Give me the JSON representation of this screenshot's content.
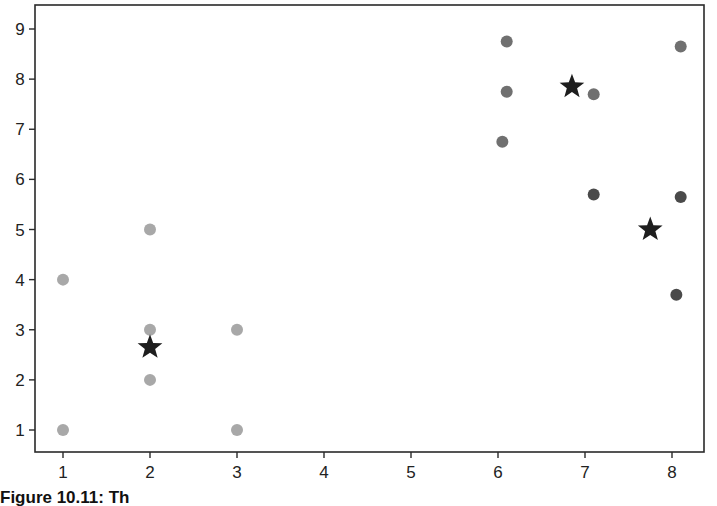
{
  "caption": "Figure 10.11: Th",
  "chart_data": {
    "type": "scatter",
    "title": "",
    "xlabel": "",
    "ylabel": "",
    "xlim": [
      0.7,
      8.3
    ],
    "ylim": [
      0.5,
      9.5
    ],
    "xticks": [
      1,
      2,
      3,
      4,
      5,
      6,
      7,
      8
    ],
    "yticks": [
      1,
      2,
      3,
      4,
      5,
      6,
      7,
      8,
      9
    ],
    "grid": false,
    "legend": null,
    "series": [
      {
        "name": "cluster-1",
        "marker": "circle",
        "color": "#a8a8a8",
        "points": [
          [
            1,
            4
          ],
          [
            2,
            5
          ],
          [
            2,
            3
          ],
          [
            2,
            2
          ],
          [
            1,
            1
          ],
          [
            3,
            3
          ],
          [
            3,
            1
          ]
        ]
      },
      {
        "name": "cluster-2",
        "marker": "circle",
        "color": "#707070",
        "points": [
          [
            6.1,
            8.75
          ],
          [
            6.1,
            7.75
          ],
          [
            6.05,
            6.75
          ],
          [
            7.1,
            7.7
          ],
          [
            8.1,
            8.65
          ]
        ]
      },
      {
        "name": "cluster-3",
        "marker": "circle",
        "color": "#4a4a4a",
        "points": [
          [
            7.1,
            5.7
          ],
          [
            8.1,
            5.65
          ],
          [
            8.05,
            3.7
          ]
        ]
      },
      {
        "name": "centroids",
        "marker": "star",
        "color": "#1e1e1e",
        "points": [
          [
            2.0,
            2.65
          ],
          [
            6.85,
            7.85
          ],
          [
            7.75,
            5.0
          ]
        ]
      }
    ]
  }
}
